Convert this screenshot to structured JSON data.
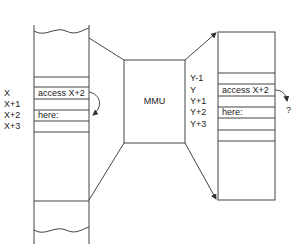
{
  "mmu": {
    "label": "MMU"
  },
  "left_memory": {
    "addresses": [
      "X",
      "X+1",
      "X+2",
      "X+3"
    ],
    "cells": [
      "access  X+2",
      "",
      "here:",
      ""
    ]
  },
  "right_memory": {
    "addresses": [
      "Y-1",
      "Y",
      "Y+1",
      "Y+2",
      "Y+3"
    ],
    "cells": [
      "",
      "access  X+2",
      "",
      "here:",
      ""
    ],
    "unknown_target": "?"
  },
  "colors": {
    "line": "#444444",
    "text": "#222222",
    "background": "#ffffff"
  }
}
